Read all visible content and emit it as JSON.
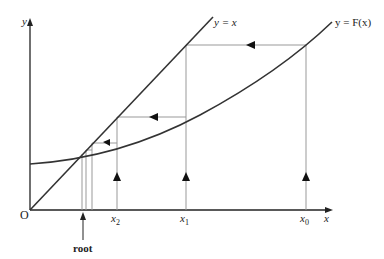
{
  "diagram": {
    "axes": {
      "y_label": "y",
      "x_label": "x",
      "origin_label": "O"
    },
    "curves": {
      "line_label": "y = x",
      "curve_label": "y = F(x)"
    },
    "tick_labels": {
      "x0": "x",
      "x0_sub": "0",
      "x1": "x",
      "x1_sub": "1",
      "x2": "x",
      "x2_sub": "2"
    },
    "root_label": "root",
    "colors": {
      "axis": "#222222",
      "curve": "#333333",
      "guide": "#999999",
      "background": "#ffffff"
    }
  }
}
